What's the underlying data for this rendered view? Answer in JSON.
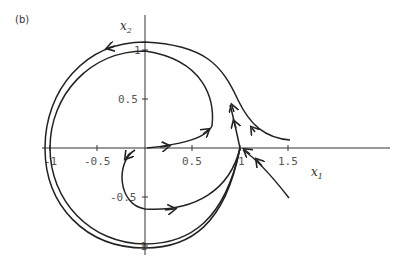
{
  "figure": {
    "panel_label": "(b)",
    "x_axis_label": "x1",
    "x_axis_sub": "1",
    "y_axis_label": "x2",
    "y_axis_sub": "2",
    "x_ticks": [
      "-1",
      "-0.5",
      "0.5",
      "1",
      "1.5"
    ],
    "y_ticks": [
      "1",
      "0.5",
      "-0.5",
      "-1"
    ]
  }
}
